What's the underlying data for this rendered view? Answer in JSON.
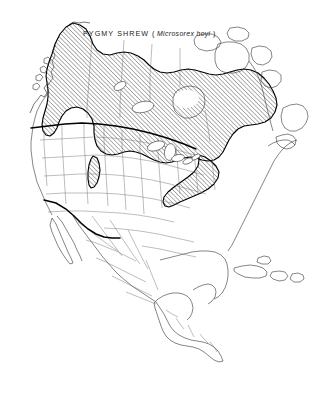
{
  "figure": {
    "kind": "species-range-map",
    "background_color": "#ffffff",
    "width": 324,
    "height": 397
  },
  "title": {
    "common_name": "PYGMY SHREW",
    "open_paren": "(",
    "scientific_name": "Microsorex hoyi",
    "close_paren": ")",
    "x": 83,
    "y": 36
  },
  "map": {
    "region": "North America",
    "projection_note": "continental outline with state and province boundaries",
    "coastline_color": "#3a3a3a",
    "internal_border_color": "#6b6b6b",
    "emphasized_border_color": "#000000",
    "range_outline_color": "#000000",
    "hatch_color": "#4a4a4a",
    "hatch_angle_degrees": 45,
    "hatch_spacing_px": 3,
    "water_fill": "#ffffff",
    "land_fill": "#ffffff"
  },
  "legend": {
    "range_description": "hatched area indicates species distribution",
    "hatch_pattern_name": "diagonal-hatch"
  },
  "range_areas": [
    {
      "name": "main-boreal-range",
      "description": "Alaska interior through boreal Canada east to Labrador and the northern United States"
    },
    {
      "name": "appalachian-extension",
      "description": "narrow southwest tongue along the Appalachian Mountains"
    },
    {
      "name": "rocky-mountain-isolate",
      "description": "isolated patch in the southern Rocky Mountains of Colorado"
    },
    {
      "name": "western-cordillera-lobe",
      "description": "southward lobe along the Rocky Mountains of Alberta and Montana"
    }
  ],
  "emphasized_boundaries": [
    {
      "name": "usa-canada-border"
    },
    {
      "name": "usa-mexico-border"
    }
  ]
}
